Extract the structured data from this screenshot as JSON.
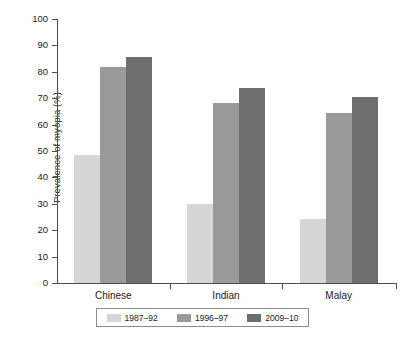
{
  "chart_data": {
    "type": "bar",
    "title": "",
    "xlabel": "",
    "ylabel": "Prevalence of myopia (%)",
    "ylim": [
      0,
      100
    ],
    "ytick_step": 10,
    "yticks": [
      "100",
      "90",
      "80",
      "70",
      "60",
      "50",
      "40",
      "30",
      "20",
      "10",
      "0"
    ],
    "grid": false,
    "legend_position": "bottom",
    "categories": [
      "Chinese",
      "Indian",
      "Malay"
    ],
    "series": [
      {
        "name": "1987–92",
        "color": "#d6d6d6",
        "values": [
          48.5,
          29.8,
          24.3
        ]
      },
      {
        "name": "1996–97",
        "color": "#9a9a9a",
        "values": [
          82.0,
          68.2,
          64.4
        ]
      },
      {
        "name": "2009–10",
        "color": "#6e6e6e",
        "values": [
          85.8,
          74.0,
          70.3
        ]
      }
    ]
  },
  "axis": {
    "line_color": "#4d4d4d"
  }
}
